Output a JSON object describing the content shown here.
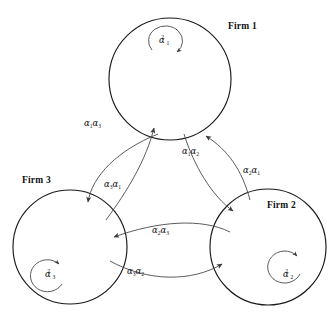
{
  "figure": {
    "type": "diagram",
    "subtype": "node-link-graph",
    "width": 335,
    "height": 322,
    "background_color": "#ffffff",
    "stroke_color": "#1a1a1a",
    "arc_color": "#4a4a4a"
  },
  "nodes": [
    {
      "id": "firm1",
      "label": "Firm 1",
      "label_x": 228,
      "label_y": 22,
      "cx": 170,
      "cy": 79,
      "r": 61,
      "self_loop": {
        "alpha": "α",
        "sub": "1",
        "sup": "2",
        "label_x": 159,
        "label_y": 36,
        "direction": "clockwise"
      }
    },
    {
      "id": "firm2",
      "label": "Firm 2",
      "label_x": 267,
      "label_y": 201,
      "cx": 268,
      "cy": 247,
      "r": 58,
      "self_loop": {
        "alpha": "α",
        "sub": "2",
        "sup": "2",
        "label_x": 283,
        "label_y": 270,
        "direction": "counterclockwise"
      }
    },
    {
      "id": "firm3",
      "label": "Firm 3",
      "label_x": 22,
      "label_y": 176,
      "cx": 70,
      "cy": 247,
      "r": 57,
      "self_loop": {
        "alpha": "α",
        "sub": "3",
        "sup": "2",
        "label_x": 45,
        "label_y": 270,
        "direction": "counterclockwise"
      }
    }
  ],
  "edges": [
    {
      "id": "e-a1a3",
      "from": "firm1",
      "to": "firm3",
      "alpha": "α",
      "sub_first": "1",
      "sub_second": "3",
      "label_x": 84,
      "label_y": 119,
      "path": "M 154 140 C 120 154 95 175 90 200"
    },
    {
      "id": "e-a3a1",
      "from": "firm3",
      "to": "firm1",
      "alpha": "α",
      "sub_first": "3",
      "sub_second": "1",
      "label_x": 104,
      "label_y": 180,
      "path": "M 103 216 C 125 186 146 158 155 131"
    },
    {
      "id": "e-a1a2",
      "from": "firm1",
      "to": "firm2",
      "alpha": "α",
      "sub_first": "1",
      "sub_second": "2",
      "label_x": 182,
      "label_y": 147,
      "path": "M 186 137 C 196 168 214 196 235 213"
    },
    {
      "id": "e-a2a1",
      "from": "firm2",
      "to": "firm1",
      "alpha": "α",
      "sub_first": "2",
      "sub_second": "1",
      "label_x": 243,
      "label_y": 166,
      "path": "M 248 196 C 240 168 228 149 208 138"
    },
    {
      "id": "e-a2a3",
      "from": "firm2",
      "to": "firm3",
      "alpha": "α",
      "sub_first": "2",
      "sub_second": "3",
      "label_x": 152,
      "label_y": 226,
      "path": "M 227 231 C 200 219 160 222 116 238"
    },
    {
      "id": "e-a3a2",
      "from": "firm3",
      "to": "firm2",
      "alpha": "α",
      "sub_first": "3",
      "sub_second": "2",
      "label_x": 127,
      "label_y": 267,
      "path": "M 112 262 C 150 282 192 282 221 265"
    }
  ]
}
